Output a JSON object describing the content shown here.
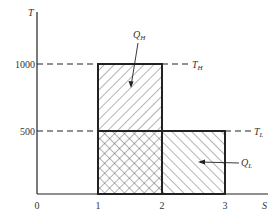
{
  "diagram": {
    "type": "T-S diagram (Carnot cycle heat transfer areas)",
    "axes": {
      "x_label": "S",
      "y_label": "T",
      "x_ticks": [
        "0",
        "1",
        "2",
        "3"
      ],
      "y_ticks": [
        "500",
        "1000"
      ]
    },
    "levels": {
      "high": {
        "value": "1000",
        "label_main": "T",
        "label_sub": "H"
      },
      "low": {
        "value": "500",
        "label_main": "T",
        "label_sub": "L"
      }
    },
    "regions": [
      {
        "name": "Q_H",
        "label_main": "Q",
        "label_sub": "H",
        "s_range": [
          1,
          2
        ],
        "t_range": [
          0,
          1000
        ],
        "hatch": "forward-diagonal"
      },
      {
        "name": "Q_L",
        "label_main": "Q",
        "label_sub": "L",
        "s_range": [
          1,
          3
        ],
        "t_range": [
          0,
          500
        ],
        "hatch": "back-diagonal"
      },
      {
        "name": "overlap",
        "s_range": [
          1,
          2
        ],
        "t_range": [
          0,
          500
        ],
        "hatch": "cross-hatch"
      }
    ]
  }
}
